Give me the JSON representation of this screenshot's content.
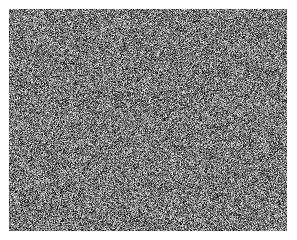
{
  "image": {
    "description": "grayscale random noise field",
    "background": "#ffffff",
    "noise_region": {
      "x": 9,
      "y": 9,
      "width": 278,
      "height": 222
    },
    "noise_colors": {
      "min": "#000000",
      "max": "#ffffff",
      "mean": "#6e6e6e"
    }
  }
}
